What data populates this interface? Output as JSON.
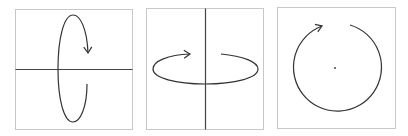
{
  "diagram": {
    "title": "",
    "colors": {
      "frame": "#c8c8c8",
      "axis": "#333333",
      "curve": "#333333",
      "background": "#ffffff"
    },
    "panels": [
      {
        "id": "panel-1",
        "description": "rotation about horizontal axis (vertical ellipse with arrow)",
        "frame": {
          "x": 15,
          "y": 9,
          "w": 117,
          "h": 120
        },
        "axis": "horizontal",
        "rotation_path": "vertical-ellipse"
      },
      {
        "id": "panel-2",
        "description": "rotation about vertical axis (horizontal ellipse with arrow)",
        "frame": {
          "x": 146,
          "y": 8,
          "w": 117,
          "h": 121
        },
        "axis": "vertical",
        "rotation_path": "horizontal-ellipse"
      },
      {
        "id": "panel-3",
        "description": "rotation about axis perpendicular to the page (circle with center dot)",
        "frame": {
          "x": 277,
          "y": 7,
          "w": 118,
          "h": 121
        },
        "axis": "out-of-plane point",
        "rotation_path": "circle"
      }
    ]
  }
}
